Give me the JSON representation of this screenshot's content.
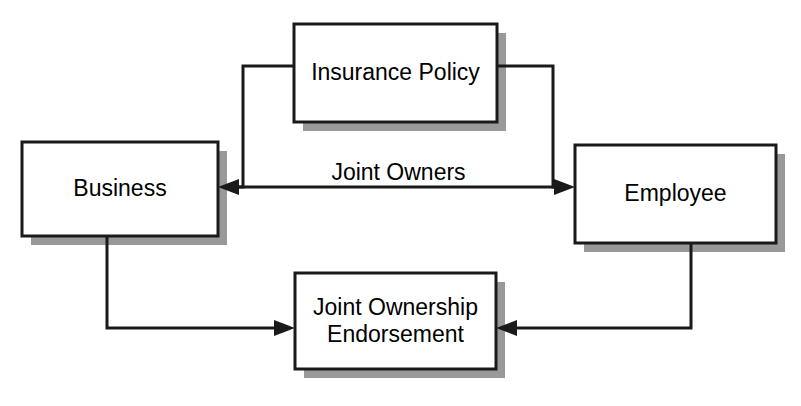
{
  "diagram": {
    "background_color": "#ffffff",
    "line_color": "#1a1a1a",
    "shadow_color": "#999999",
    "box_fill_color": "#ffffff",
    "nodes": [
      {
        "id": "insurance-policy",
        "label": "Insurance Policy",
        "x": 294,
        "y": 24,
        "width": 203,
        "height": 98
      },
      {
        "id": "business",
        "label": "Business",
        "x": 22,
        "y": 142,
        "width": 196,
        "height": 94
      },
      {
        "id": "employee",
        "label": "Employee",
        "x": 575,
        "y": 145,
        "width": 201,
        "height": 98
      },
      {
        "id": "joint-ownership-endorsement",
        "label": "Joint Ownership\nEndorsement",
        "x": 295,
        "y": 273,
        "width": 201,
        "height": 96
      }
    ],
    "edges": [
      {
        "id": "business-employee",
        "label": "Joint Owners",
        "label_x": 398,
        "label_y": 172,
        "from": "business",
        "to": "employee",
        "arrowheads": "both"
      },
      {
        "id": "policy-to-business",
        "label": "",
        "from": "insurance-policy",
        "to": "business",
        "arrowheads": "end"
      },
      {
        "id": "policy-to-employee",
        "label": "",
        "from": "insurance-policy",
        "to": "employee",
        "arrowheads": "end"
      },
      {
        "id": "business-to-endorsement",
        "label": "",
        "from": "business",
        "to": "joint-ownership-endorsement",
        "arrowheads": "end"
      },
      {
        "id": "employee-to-endorsement",
        "label": "",
        "from": "employee",
        "to": "joint-ownership-endorsement",
        "arrowheads": "end"
      }
    ]
  }
}
